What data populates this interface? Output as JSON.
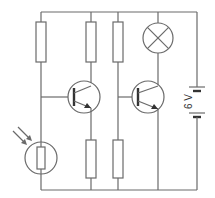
{
  "diagram": {
    "type": "circuit-schematic",
    "battery": {
      "label": "6 V"
    },
    "components": [
      {
        "id": "R1",
        "kind": "resistor"
      },
      {
        "id": "R2",
        "kind": "resistor"
      },
      {
        "id": "R3",
        "kind": "resistor"
      },
      {
        "id": "LAMP",
        "kind": "lamp"
      },
      {
        "id": "T1",
        "kind": "npn-transistor"
      },
      {
        "id": "T2",
        "kind": "npn-transistor"
      },
      {
        "id": "LDR",
        "kind": "light-dependent-resistor"
      },
      {
        "id": "R4",
        "kind": "resistor"
      },
      {
        "id": "R5",
        "kind": "resistor"
      },
      {
        "id": "BAT",
        "kind": "battery"
      }
    ],
    "colors": {
      "line": "#6a6a6a",
      "text": "#333333",
      "background": "#ffffff"
    }
  }
}
